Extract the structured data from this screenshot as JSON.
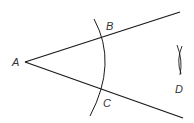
{
  "diagram": {
    "type": "geometric-construction",
    "colors": {
      "stroke": "#1a1a1a",
      "label": "#333333",
      "background": "#ffffff"
    },
    "points": [
      {
        "id": "A",
        "label": "A",
        "role": "vertex"
      },
      {
        "id": "B",
        "label": "B",
        "role": "arc-intersection-upper-ray"
      },
      {
        "id": "C",
        "label": "C",
        "role": "arc-intersection-lower-ray"
      },
      {
        "id": "D",
        "label": "D",
        "role": "intersection-of-construction-arcs"
      }
    ],
    "elements": [
      {
        "type": "ray",
        "from": "A",
        "through": "B"
      },
      {
        "type": "ray",
        "from": "A",
        "through": "C"
      },
      {
        "type": "arc",
        "center": "A",
        "crosses": [
          "B",
          "C"
        ]
      },
      {
        "type": "arc-pair",
        "near": "D"
      }
    ]
  }
}
